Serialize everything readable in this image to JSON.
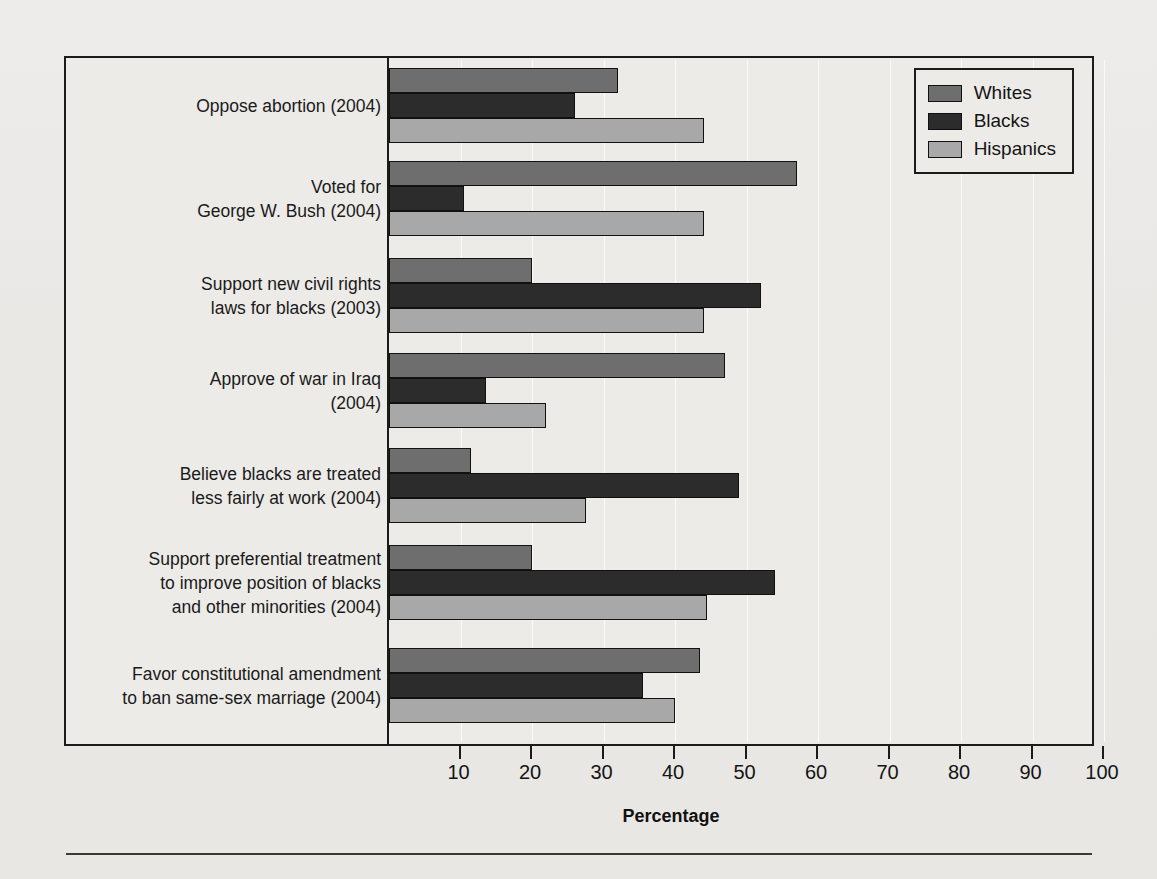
{
  "chart_data": {
    "type": "bar",
    "orientation": "horizontal",
    "title": "",
    "xlabel": "Percentage",
    "ylabel": "",
    "xlim": [
      0,
      100
    ],
    "xticks": [
      10,
      20,
      30,
      40,
      50,
      60,
      70,
      80,
      90,
      100
    ],
    "grid": true,
    "legend_position": "top-right",
    "categories": [
      "Oppose abortion (2004)",
      "Voted for\nGeorge W. Bush (2004)",
      "Support new civil rights\nlaws for blacks (2003)",
      "Approve of war in Iraq\n(2004)",
      "Believe blacks are treated\nless fairly at work (2004)",
      "Support preferential treatment\nto improve position of blacks\nand other minorities (2004)",
      "Favor constitutional amendment\nto ban same-sex marriage (2004)"
    ],
    "series": [
      {
        "name": "Whites",
        "color": "#6e6e6e",
        "values": [
          32,
          57,
          20,
          47,
          11.5,
          20,
          43.5
        ]
      },
      {
        "name": "Blacks",
        "color": "#2c2c2c",
        "values": [
          26,
          10.5,
          52,
          13.5,
          49,
          54,
          35.5
        ]
      },
      {
        "name": "Hispanics",
        "color": "#a8a8a8",
        "values": [
          44,
          44,
          44,
          22,
          27.5,
          44.5,
          40
        ]
      }
    ]
  },
  "legend": {
    "items": [
      {
        "label": "Whites"
      },
      {
        "label": "Blacks"
      },
      {
        "label": "Hispanics"
      }
    ]
  },
  "axis": {
    "title": "Percentage",
    "tick_labels": [
      "10",
      "20",
      "30",
      "40",
      "50",
      "60",
      "70",
      "80",
      "90",
      "100"
    ]
  }
}
